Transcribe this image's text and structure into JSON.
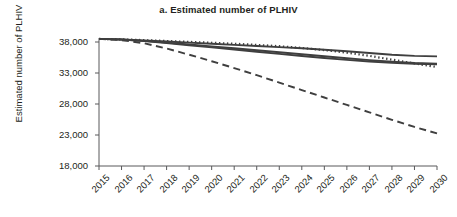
{
  "chart_data": {
    "type": "line",
    "title": "a. Estimated number of PLHIV",
    "xlabel": "",
    "ylabel": "Estimated number of PLHIV",
    "x": [
      2015,
      2016,
      2017,
      2018,
      2019,
      2020,
      2021,
      2022,
      2023,
      2024,
      2025,
      2026,
      2027,
      2028,
      2029,
      2030
    ],
    "xtick_labels": [
      "2015",
      "2016",
      "2017",
      "2018",
      "2019",
      "2020",
      "2021",
      "2022",
      "2023",
      "2024",
      "2025",
      "2026",
      "2027",
      "2028",
      "2029",
      "2030"
    ],
    "ytick_labels": [
      "18,000",
      "23,000",
      "28,000",
      "33,000",
      "38,000"
    ],
    "ytick_values": [
      18000,
      23000,
      28000,
      33000,
      38000
    ],
    "ylim": [
      18000,
      38000
    ],
    "xlim": [
      2015,
      2030
    ],
    "grid": false,
    "legend": "none",
    "line_color": "#3f3f3f",
    "series": [
      {
        "name": "scenario-1-solid-upper",
        "style": "solid",
        "values": [
          38500,
          38420,
          38260,
          38080,
          37900,
          37720,
          37540,
          37360,
          37180,
          36980,
          36760,
          36500,
          36220,
          35940,
          35760,
          35680
        ]
      },
      {
        "name": "scenario-2-solid-middle",
        "style": "solid",
        "values": [
          38500,
          38400,
          38180,
          37900,
          37600,
          37290,
          36980,
          36660,
          36340,
          36020,
          35700,
          35380,
          35080,
          34820,
          34620,
          34500
        ]
      },
      {
        "name": "scenario-3-solid-lower",
        "style": "solid",
        "values": [
          38500,
          38390,
          38140,
          37820,
          37480,
          37130,
          36780,
          36430,
          36080,
          35740,
          35420,
          35120,
          34860,
          34640,
          34480,
          34400
        ]
      },
      {
        "name": "scenario-4-dotted",
        "style": "dotted",
        "values": [
          38500,
          38430,
          38300,
          38160,
          38020,
          37880,
          37720,
          37540,
          37320,
          37040,
          36700,
          36280,
          35760,
          35160,
          34540,
          33960
        ]
      },
      {
        "name": "scenario-5-dashed",
        "style": "dashed",
        "values": [
          38500,
          38300,
          37800,
          36950,
          35950,
          34900,
          33800,
          32650,
          31450,
          30250,
          29050,
          27850,
          26650,
          25450,
          24300,
          23250
        ]
      }
    ]
  }
}
